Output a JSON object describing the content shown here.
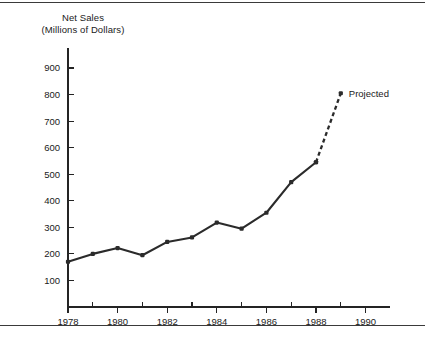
{
  "figure": {
    "top_rule": "",
    "bottom_rule": ""
  },
  "chart_data": {
    "type": "line",
    "title": "Net Sales",
    "subtitle": "(Millions of Dollars)",
    "xlabel": "",
    "ylabel": "",
    "xlim": [
      1977.6,
      1991.2
    ],
    "ylim": [
      0,
      950
    ],
    "grid": false,
    "legend_position": "none",
    "x_ticks_major": [
      "1978",
      "1980",
      "1982",
      "1984",
      "1986",
      "1988",
      "1990"
    ],
    "x_ticks_major_values": [
      1978,
      1980,
      1982,
      1984,
      1986,
      1988,
      1990
    ],
    "x_ticks_minor_values": [
      1979,
      1981,
      1983,
      1985,
      1987,
      1989,
      1991
    ],
    "y_ticks": [
      "100",
      "200",
      "300",
      "400",
      "500",
      "600",
      "700",
      "800",
      "900"
    ],
    "y_tick_values": [
      100,
      200,
      300,
      400,
      500,
      600,
      700,
      800,
      900
    ],
    "series": [
      {
        "name": "Net Sales (actual)",
        "style": "solid",
        "color": "#2b2b2b",
        "markers": true,
        "x": [
          1978,
          1979,
          1980,
          1981,
          1982,
          1983,
          1984,
          1985,
          1986,
          1987,
          1988
        ],
        "values": [
          170,
          200,
          222,
          195,
          245,
          262,
          318,
          295,
          355,
          470,
          545
        ]
      },
      {
        "name": "Net Sales (projected)",
        "style": "dashed",
        "color": "#2b2b2b",
        "markers": true,
        "x": [
          1988,
          1989
        ],
        "values": [
          545,
          805
        ]
      }
    ],
    "annotations": [
      {
        "text": "Projected",
        "x": 1989,
        "y": 805
      }
    ]
  }
}
